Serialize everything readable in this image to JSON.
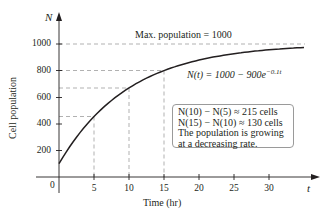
{
  "chart_data": {
    "type": "line",
    "title": "",
    "xlabel": "Time (hr)",
    "ylabel": "Cell population",
    "x_axis_symbol": "t",
    "y_axis_symbol": "N",
    "xlim": [
      0,
      35
    ],
    "ylim": [
      0,
      1100
    ],
    "x_ticks": [
      5,
      10,
      15,
      20,
      25,
      30
    ],
    "y_ticks": [
      200,
      400,
      600,
      800,
      1000
    ],
    "origin_label": "0",
    "grid": false,
    "legend": null,
    "series": [
      {
        "name": "N(t) = 1000 - 900e^(-0.1t)",
        "function": "1000 - 900*exp(-0.1*t)",
        "x": [
          0,
          5,
          10,
          15,
          20,
          25,
          30,
          35
        ],
        "values": [
          100,
          454,
          669,
          799,
          878,
          926,
          955,
          973
        ]
      }
    ],
    "reference_lines": [
      {
        "type": "horizontal",
        "y": 1000,
        "label": "Max. population = 1000",
        "style": "dashed"
      },
      {
        "type": "horizontal",
        "y": 800,
        "style": "dashed"
      },
      {
        "type": "guide",
        "x": 5,
        "y": 454,
        "style": "dashed"
      },
      {
        "type": "guide",
        "x": 10,
        "y": 669,
        "style": "dashed"
      },
      {
        "type": "guide",
        "x": 15,
        "y": 799,
        "style": "dashed"
      }
    ],
    "annotations": [
      "Max. population = 1000",
      "N(t) = 1000 − 900e^(−0.1t)",
      "N(10) − N(5) ≈ 215 cells",
      "N(15) − N(10) ≈ 130 cells",
      "The population is growing at a decreasing rate."
    ]
  },
  "labels": {
    "y_axis_symbol": "N",
    "x_axis_symbol": "t",
    "ylabel": "Cell population",
    "xlabel": "Time (hr)",
    "origin": "0",
    "max_label": "Max. population = 1000",
    "eq_lhs": "N(t) = 1000 − 900e",
    "eq_exp": "−0.1t",
    "note_line1": "N(10) − N(5) ≈ 215 cells",
    "note_line2": "N(15) − N(10) ≈ 130 cells",
    "note_line3": "The population is growing",
    "note_line4": "at a decreasing rate."
  },
  "ticks": {
    "x": [
      "5",
      "10",
      "15",
      "20",
      "25",
      "30"
    ],
    "y": [
      "1000",
      "800",
      "600",
      "400",
      "200"
    ]
  },
  "colors": {
    "curve": "#231f20",
    "axis": "#231f20",
    "dashed": "#a8a8a8",
    "note_border": "#9a9a9a"
  }
}
